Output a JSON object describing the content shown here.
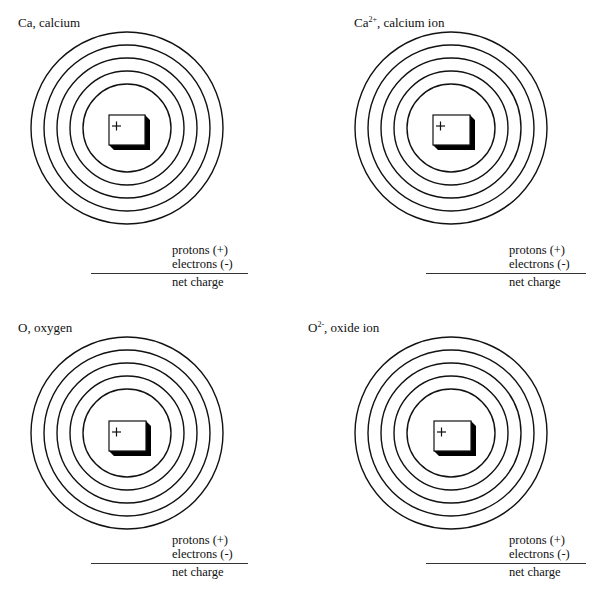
{
  "colors": {
    "ink": "#111111",
    "background": "#ffffff",
    "nucleus_shadow": "#000000"
  },
  "panels": [
    {
      "id": "ca",
      "title_main": "Ca",
      "title_sup": "",
      "title_rest": ", calcium",
      "nucleus_symbol": "+",
      "shell_count": 5,
      "tally": {
        "protons_label": "protons (+)",
        "electrons_label": "electrons (-)",
        "net_charge_label": "net charge"
      }
    },
    {
      "id": "ca2plus",
      "title_main": "Ca",
      "title_sup": "2+",
      "title_rest": ", calcium ion",
      "nucleus_symbol": "+",
      "shell_count": 5,
      "tally": {
        "protons_label": "protons (+)",
        "electrons_label": "electrons (-)",
        "net_charge_label": "net charge"
      }
    },
    {
      "id": "o",
      "title_main": "O",
      "title_sup": "",
      "title_rest": ", oxygen",
      "nucleus_symbol": "+",
      "shell_count": 5,
      "tally": {
        "protons_label": "protons (+)",
        "electrons_label": "electrons (-)",
        "net_charge_label": "net charge"
      }
    },
    {
      "id": "o2minus",
      "title_main": "O",
      "title_sup": "2-",
      "title_rest": ", oxide ion",
      "nucleus_symbol": "+",
      "shell_count": 5,
      "tally": {
        "protons_label": "protons (+)",
        "electrons_label": "electrons (-)",
        "net_charge_label": "net charge"
      }
    }
  ]
}
